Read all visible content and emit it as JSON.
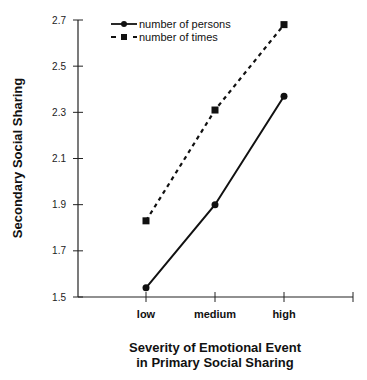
{
  "chart_data": {
    "type": "line",
    "title": "",
    "xlabel": "Severity of Emotional Event in Primary Social Sharing",
    "xlabel_lines": [
      "Severity of Emotional Event",
      "in Primary Social Sharing"
    ],
    "ylabel": "Secondary Social Sharing",
    "categories": [
      "low",
      "medium",
      "high"
    ],
    "ylim": [
      1.5,
      2.7
    ],
    "yticks": [
      "1.5",
      "1.7",
      "1.9",
      "2.1",
      "2.3",
      "2.5",
      "2.7"
    ],
    "grid": false,
    "legend_position": "top-left",
    "series": [
      {
        "name": "number of persons",
        "values": [
          1.54,
          1.9,
          2.37
        ],
        "style": "solid",
        "marker": "circle"
      },
      {
        "name": "number of times",
        "values": [
          1.83,
          2.31,
          2.68
        ],
        "style": "dashed",
        "marker": "square"
      }
    ]
  }
}
